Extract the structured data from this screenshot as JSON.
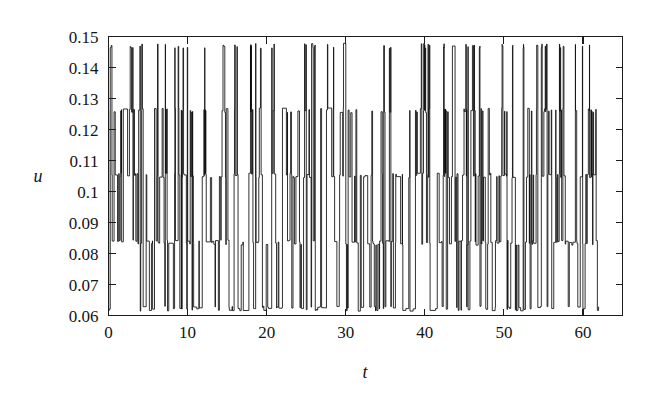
{
  "figure": {
    "background_color": "#ffffff",
    "ink_color": "#0d0d0d",
    "width": 653,
    "height": 394
  },
  "axes": {
    "y_title": "u",
    "x_title": "t",
    "y_tick_labels": [
      "0.06",
      "0.07",
      "0.08",
      "0.09",
      "0.1",
      "0.11",
      "0.12",
      "0.13",
      "0.14",
      "0.15"
    ],
    "x_tick_labels": [
      "0",
      "10",
      "20",
      "30",
      "40",
      "50",
      "60"
    ]
  },
  "chart_data": {
    "type": "line",
    "title": "",
    "xlabel": "t",
    "ylabel": "u",
    "xlim": [
      0,
      65
    ],
    "ylim": [
      0.06,
      0.15
    ],
    "x_ticks": [
      0,
      10,
      20,
      30,
      40,
      50,
      60
    ],
    "y_ticks": [
      0.06,
      0.07,
      0.08,
      0.09,
      0.1,
      0.11,
      0.12,
      0.13,
      0.14,
      0.15
    ],
    "grid": false,
    "legend": "none",
    "series": [
      {
        "name": "u(t)",
        "color": "#0d0d0d",
        "x_range": [
          0.0,
          62.0
        ],
        "sample_count": 1400,
        "plateau_levels": [
          0.0622,
          0.0835,
          0.1052,
          0.1262,
          0.147
        ],
        "band_edges": [
          0.0622,
          0.0835,
          0.1052,
          0.1262,
          0.147
        ],
        "level_occupancy": [
          0.22,
          0.3,
          0.26,
          0.14,
          0.08
        ],
        "value_min": 0.0622,
        "value_max": 0.147,
        "data_end_t": 62.0
      }
    ]
  }
}
